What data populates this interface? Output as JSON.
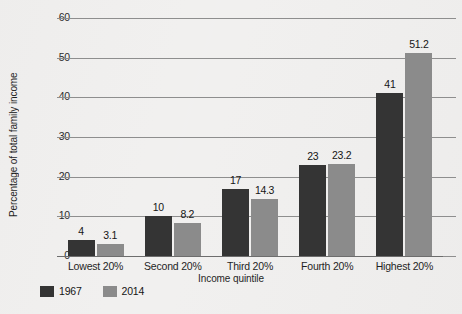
{
  "chart_data": {
    "type": "bar",
    "title": "",
    "subtitle": "",
    "xlabel": "Income quintile",
    "ylabel": "Percentage of total family income",
    "categories": [
      "Lowest 20%",
      "Second 20%",
      "Third 20%",
      "Fourth 20%",
      "Highest 20%"
    ],
    "series": [
      {
        "name": "1967",
        "color": "#343434",
        "values": [
          4,
          10,
          17,
          23,
          41
        ]
      },
      {
        "name": "2014",
        "color": "#8b8b8b",
        "values": [
          3.1,
          8.2,
          14.3,
          23.2,
          51.2
        ]
      }
    ],
    "value_labels": {
      "1967": [
        "4",
        "10",
        "17",
        "23",
        "41"
      ],
      "2014": [
        "3.1",
        "8.2",
        "14.3",
        "23.2",
        "51.2"
      ]
    },
    "ylim": [
      0,
      60
    ],
    "yticks": [
      0,
      10,
      20,
      30,
      40,
      50,
      60
    ],
    "ytick_labels": [
      "0",
      "10",
      "20",
      "30",
      "40",
      "50",
      "60"
    ],
    "grid": true,
    "grid_axis": "y",
    "legend": {
      "position": "bottom-left",
      "entries": [
        "1967",
        "2014"
      ]
    },
    "background_color": "#f1f0ef",
    "grid_color": "#8e8e8e"
  }
}
